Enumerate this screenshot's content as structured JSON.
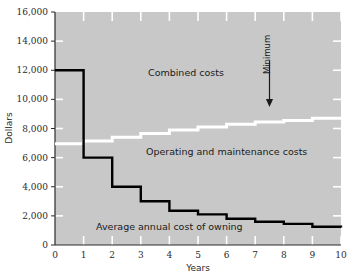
{
  "chart_data": {
    "type": "line",
    "title": "",
    "xlabel": "Years",
    "ylabel": "Dollars",
    "xlim": [
      0,
      10
    ],
    "ylim": [
      0,
      16000
    ],
    "grid": false,
    "x_ticks": [
      "0",
      "1",
      "2",
      "3",
      "4",
      "5",
      "6",
      "7",
      "8",
      "9",
      "10"
    ],
    "y_ticks": [
      "0",
      "2,000",
      "4,000",
      "6,000",
      "8,000",
      "10,000",
      "12,000",
      "14,000",
      "16,000"
    ],
    "x_tick_values": [
      0,
      1,
      2,
      3,
      4,
      5,
      6,
      7,
      8,
      9,
      10
    ],
    "y_tick_values": [
      0,
      2000,
      4000,
      6000,
      8000,
      10000,
      12000,
      14000,
      16000
    ],
    "legend_position": "inline-annotations",
    "series": [
      {
        "name": "Combined costs",
        "color": "#595959",
        "style": "step",
        "label_text": "Combined costs",
        "x": [
          0,
          1,
          2,
          3,
          4,
          5,
          6,
          7,
          8,
          9,
          10
        ],
        "values": [
          15350,
          12650,
          10750,
          10100,
          9650,
          9500,
          9450,
          9350,
          9350,
          9400,
          9450
        ]
      },
      {
        "name": "Operating and maintenance costs",
        "color": "#ffffff",
        "style": "step",
        "label_text": "Operating and maintenance costs",
        "x": [
          0,
          1,
          2,
          3,
          4,
          5,
          6,
          7,
          8,
          9,
          10
        ],
        "values": [
          6950,
          7150,
          7400,
          7650,
          7900,
          8100,
          8300,
          8450,
          8550,
          8700,
          8800
        ]
      },
      {
        "name": "Average annual cost of owning",
        "color": "#000000",
        "style": "step",
        "label_text": "Average annual cost of owning",
        "x": [
          0,
          1,
          2,
          3,
          4,
          5,
          6,
          7,
          8,
          9,
          10
        ],
        "values": [
          12000,
          6000,
          4000,
          3000,
          2350,
          2100,
          1800,
          1600,
          1450,
          1250,
          1200
        ]
      }
    ],
    "annotations": [
      {
        "text": "Minimum",
        "x": 7.5,
        "y_label": 13500,
        "arrow_to_y": 9400,
        "orientation": "vertical",
        "marker": "down-arrow"
      }
    ],
    "colors": {
      "plot_background": "#c8c8c8",
      "page_background": "#ffffff",
      "axis": "#2b2b2b",
      "tick_inner": "#ffffff",
      "combined": "#595959",
      "operating": "#ffffff",
      "owning": "#000000",
      "text": "#1a1a1a"
    }
  }
}
